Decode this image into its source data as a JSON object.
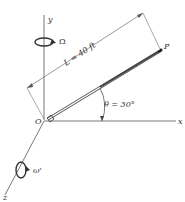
{
  "diagram": {
    "axes": {
      "x_label": "x",
      "y_label": "y",
      "z_label": "z",
      "origin_label": "O"
    },
    "boom": {
      "end_label": "P",
      "length_label": "L = 40 ft",
      "angle_label": "θ = 30°"
    },
    "rotations": {
      "y_axis_rate": "Ω",
      "z_axis_rate": "ω'"
    },
    "colors": {
      "line": "#444444",
      "boom": "#555555",
      "text": "#333333"
    }
  }
}
